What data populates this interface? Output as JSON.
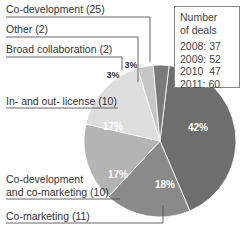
{
  "chart_data": {
    "type": "pie",
    "title": "",
    "slices": [
      {
        "label": "Co-development (25)",
        "name": "Co-development",
        "count": 25,
        "percent": 42,
        "percent_label": "42%",
        "color": "#6e6e6e"
      },
      {
        "label": "Co-marketing (11)",
        "name": "Co-marketing",
        "count": 11,
        "percent": 18,
        "percent_label": "18%",
        "color": "#8a8a8a"
      },
      {
        "label": "Co-development and co-marketing (10)",
        "label_lines": [
          "Co-development",
          "and co-marketing (10)"
        ],
        "name": "Co-development and co-marketing",
        "count": 10,
        "percent": 17,
        "percent_label": "17%",
        "color": "#b4b4b4"
      },
      {
        "label": "In- and out- license (10)",
        "name": "In- and out- license",
        "count": 10,
        "percent": 17,
        "percent_label": "17%",
        "color": "#dedede"
      },
      {
        "label": "Broad collaboration (2)",
        "name": "Broad collaboration",
        "count": 2,
        "percent": 3,
        "percent_label": "3%",
        "color": "#c6c6c6"
      },
      {
        "label": "Other (2)",
        "name": "Other",
        "count": 2,
        "percent": 3,
        "percent_label": "3%",
        "color": "#7a7a7a"
      }
    ],
    "legend_box": {
      "title_lines": [
        "Number",
        "of deals"
      ],
      "rows": [
        {
          "year": "2008:",
          "value": "37"
        },
        {
          "year": "2009:",
          "value": "52"
        },
        {
          "year": "2010",
          "value": "47"
        },
        {
          "year": "2011:",
          "value": "60"
        }
      ]
    }
  }
}
